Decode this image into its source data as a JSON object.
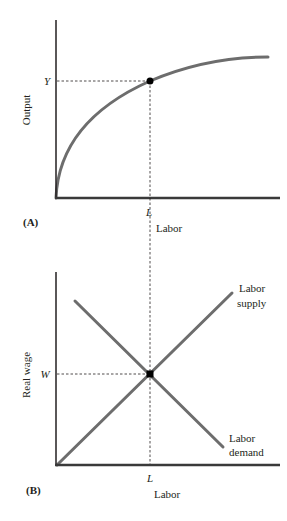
{
  "panel_a": {
    "id_label": "(A)",
    "y_axis_label": "Output",
    "x_axis_label": "Labor",
    "y_marker": "Y",
    "x_marker": "L",
    "curve": "Production function (concave, increasing)",
    "curve_color": "#6d6d6d"
  },
  "panel_b": {
    "id_label": "(B)",
    "y_axis_label": "Real wage",
    "x_axis_label": "Labor",
    "y_marker": "W",
    "x_marker": "L",
    "supply_label_1": "Labor",
    "supply_label_2": "supply",
    "demand_label_1": "Labor",
    "demand_label_2": "demand",
    "line_color": "#6d6d6d"
  },
  "colors": {
    "axis": "#231f20",
    "curve": "#6d6d6d",
    "guide": "#231f20",
    "point": "#000000"
  }
}
